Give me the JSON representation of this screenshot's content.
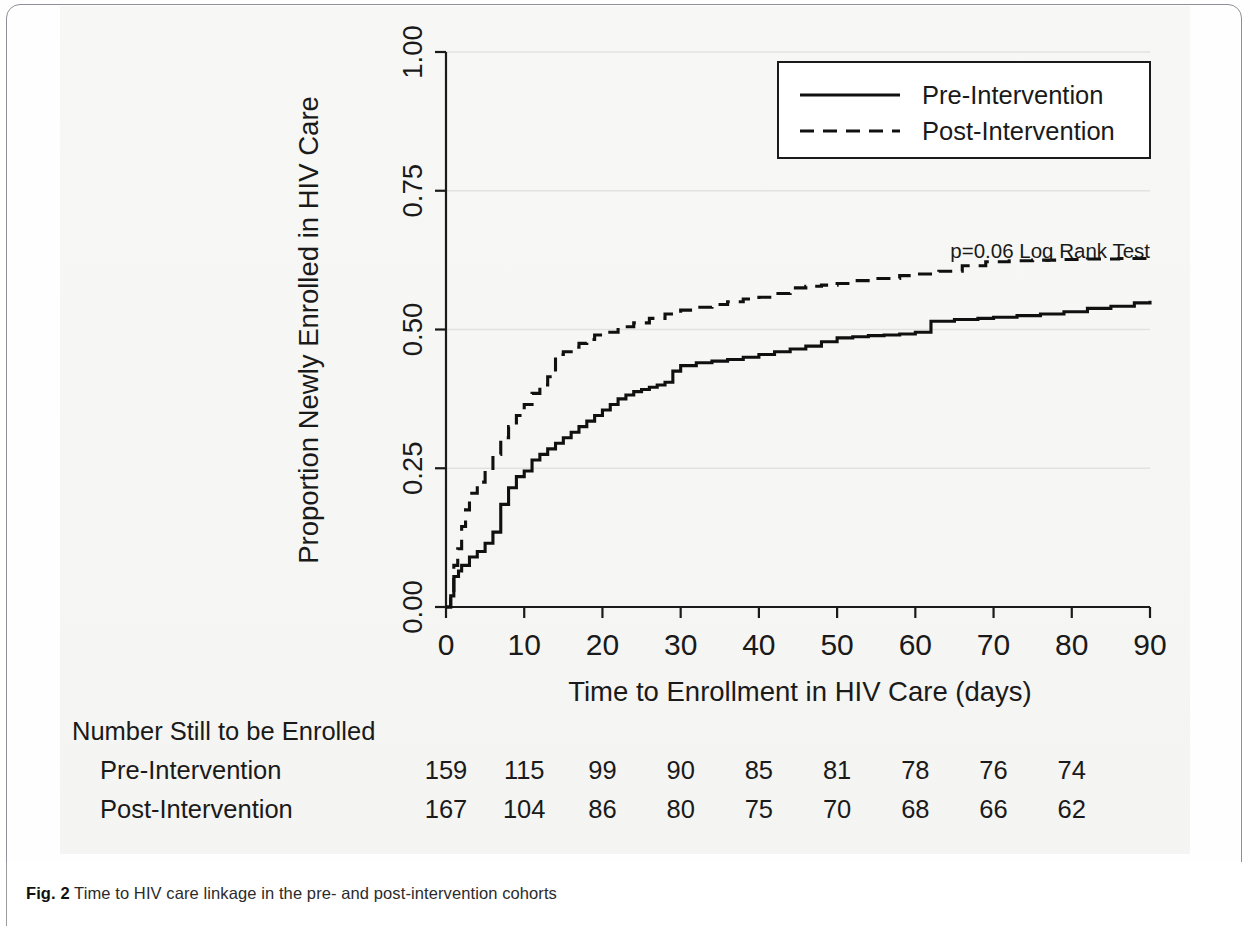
{
  "figure": {
    "caption_label": "Fig. 2",
    "caption_text": "Time to HIV care linkage in the pre- and post-intervention cohorts"
  },
  "annotation": {
    "pvalue_text": "p=0.06 Log Rank Test"
  },
  "legend": {
    "entries": [
      {
        "label": "Pre-Intervention",
        "style": "solid"
      },
      {
        "label": "Post-Intervention",
        "style": "dashed"
      }
    ]
  },
  "risk_table": {
    "title": "Number Still to be Enrolled",
    "rows": [
      {
        "label": "Pre-Intervention",
        "values": [
          159,
          115,
          99,
          90,
          85,
          81,
          78,
          76,
          74
        ]
      },
      {
        "label": "Post-Intervention",
        "values": [
          167,
          104,
          86,
          80,
          75,
          70,
          68,
          66,
          62
        ]
      }
    ],
    "times": [
      0,
      10,
      20,
      30,
      40,
      50,
      60,
      70,
      80
    ]
  },
  "chart_data": {
    "type": "line",
    "title": "",
    "xlabel": "Time to Enrollment in HIV Care (days)",
    "ylabel": "Proportion Newly Enrolled in HIV Care",
    "xlim": [
      0,
      90
    ],
    "ylim": [
      0,
      1
    ],
    "xticks": [
      0,
      10,
      20,
      30,
      40,
      50,
      60,
      70,
      80,
      90
    ],
    "xticklabels": [
      "0",
      "10",
      "20",
      "30",
      "40",
      "50",
      "60",
      "70",
      "80",
      "90"
    ],
    "yticks": [
      0.0,
      0.25,
      0.5,
      0.75,
      1.0
    ],
    "yticklabels": [
      "0.00",
      "0.25",
      "0.50",
      "0.75",
      "1.00"
    ],
    "grid": true,
    "legend_position": "top-right",
    "step_type": "post",
    "series": [
      {
        "name": "Pre-Intervention",
        "style": "solid",
        "color": "#101010",
        "x": [
          0,
          0.6,
          1,
          1.6,
          2,
          3,
          4,
          5,
          6,
          7,
          8,
          9,
          10,
          11,
          12,
          13,
          14,
          15,
          16,
          17,
          18,
          19,
          20,
          21,
          22,
          23,
          24,
          25,
          26,
          27,
          28,
          29,
          30,
          32,
          34,
          36,
          38,
          40,
          42,
          44,
          46,
          48,
          50,
          52,
          54,
          56,
          58,
          60,
          62,
          65,
          68,
          70,
          73,
          76,
          79,
          82,
          85,
          88,
          90
        ],
        "y": [
          0.0,
          0.02,
          0.055,
          0.065,
          0.075,
          0.09,
          0.1,
          0.115,
          0.135,
          0.185,
          0.215,
          0.235,
          0.245,
          0.265,
          0.275,
          0.285,
          0.295,
          0.305,
          0.315,
          0.325,
          0.335,
          0.345,
          0.355,
          0.365,
          0.375,
          0.382,
          0.388,
          0.392,
          0.396,
          0.4,
          0.405,
          0.425,
          0.435,
          0.44,
          0.443,
          0.446,
          0.45,
          0.455,
          0.46,
          0.465,
          0.47,
          0.478,
          0.485,
          0.487,
          0.489,
          0.49,
          0.492,
          0.495,
          0.515,
          0.518,
          0.52,
          0.522,
          0.525,
          0.528,
          0.532,
          0.538,
          0.542,
          0.548,
          0.552
        ]
      },
      {
        "name": "Post-Intervention",
        "style": "dashed",
        "color": "#101010",
        "x": [
          0,
          0.6,
          1,
          1.5,
          2,
          2.5,
          3,
          4,
          5,
          6,
          7,
          8,
          9,
          10,
          11,
          12,
          13,
          14,
          15,
          16,
          17,
          18,
          19,
          20,
          22,
          24,
          26,
          28,
          30,
          32,
          34,
          36,
          38,
          40,
          42,
          44,
          46,
          48,
          50,
          52,
          55,
          58,
          60,
          63,
          66,
          69,
          72,
          75,
          78,
          82,
          86,
          90
        ],
        "y": [
          0.0,
          0.03,
          0.075,
          0.105,
          0.145,
          0.175,
          0.205,
          0.225,
          0.245,
          0.275,
          0.305,
          0.325,
          0.345,
          0.365,
          0.385,
          0.4,
          0.415,
          0.455,
          0.46,
          0.468,
          0.475,
          0.482,
          0.49,
          0.495,
          0.505,
          0.512,
          0.52,
          0.528,
          0.535,
          0.54,
          0.545,
          0.55,
          0.555,
          0.558,
          0.565,
          0.575,
          0.578,
          0.58,
          0.583,
          0.588,
          0.592,
          0.597,
          0.6,
          0.605,
          0.615,
          0.622,
          0.624,
          0.625,
          0.626,
          0.627,
          0.628,
          0.628
        ]
      }
    ]
  }
}
